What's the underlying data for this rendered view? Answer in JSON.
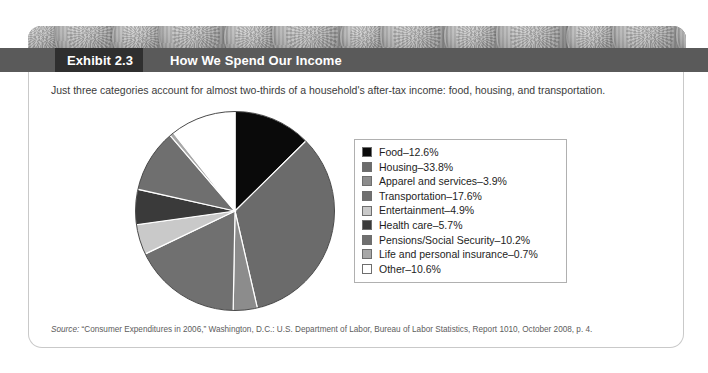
{
  "exhibit": {
    "number_label": "Exhibit 2.3",
    "title": "How We Spend Our Income",
    "intro": "Just three categories account for almost two-thirds of a household's after-tax income: food, housing, and transportation.",
    "source_prefix": "Source:",
    "source_text": " “Consumer Expenditures in 2006,” Washington, D.C.: U.S. Department of Labor, Bureau of Labor Statistics, Report 1010, October 2008, p. 4."
  },
  "colors": {
    "band": "#5a5a5a",
    "tab": "#2f2f2f",
    "card_border": "#c9c9c9",
    "legend_border": "#b0b0b0",
    "text": "#1d1d1d"
  },
  "chart_data": {
    "type": "pie",
    "title": "How We Spend Our Income",
    "start_angle_deg": 0,
    "direction": "clockwise",
    "units": "percent",
    "legend_position": "right",
    "grid": false,
    "categories": [
      "Food",
      "Housing",
      "Apparel and services",
      "Transportation",
      "Entertainment",
      "Health care",
      "Pensions/Social Security",
      "Life and personal insurance",
      "Other"
    ],
    "values": [
      12.6,
      33.8,
      3.9,
      17.6,
      4.9,
      5.7,
      10.2,
      0.7,
      10.6
    ],
    "labels": [
      "Food–12.6%",
      "Housing–33.8%",
      "Apparel and services–3.9%",
      "Transportation–17.6%",
      "Entertainment–4.9%",
      "Health care–5.7%",
      "Pensions/Social Security–10.2%",
      "Life and personal insurance–0.7%",
      "Other–10.6%"
    ],
    "slice_colors": [
      "#0a0a0a",
      "#6b6b6b",
      "#8c8c8c",
      "#707070",
      "#c9c9c9",
      "#3a3a3a",
      "#6f6f6f",
      "#a8a8a8",
      "#ffffff"
    ]
  }
}
